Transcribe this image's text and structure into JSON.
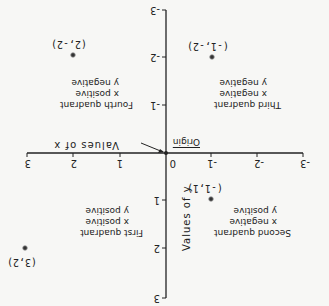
{
  "diagram": {
    "orientation_note": "Image rendered rotated 180 degrees",
    "x_axis": {
      "title": "Values of x",
      "ticks": [
        "-3",
        "-2",
        "-1",
        "0",
        "1",
        "2",
        "3"
      ]
    },
    "y_axis": {
      "title": "Values of y",
      "ticks": [
        "3",
        "2",
        "1",
        "-1",
        "-2",
        "-3"
      ]
    },
    "origin_label": "Origin",
    "zero_label": "0",
    "quadrants": [
      {
        "name": "First quadrant",
        "x": "x positive",
        "y": "y positive"
      },
      {
        "name": "Second quadrant",
        "x": "x negative",
        "y": "y positive"
      },
      {
        "name": "Third quadrant",
        "x": "x negative",
        "y": "y negative"
      },
      {
        "name": "Fourth quadrant",
        "x": "x positive",
        "y": "y negative"
      }
    ],
    "points": [
      {
        "label": "(3,2)",
        "x": 3,
        "y": 2
      },
      {
        "label": "(-1,1)",
        "x": -1,
        "y": 1
      },
      {
        "label": "(-1,-2)",
        "x": -1,
        "y": -2
      },
      {
        "label": "(2,-2)",
        "x": 2,
        "y": -2
      }
    ],
    "colors": {
      "ink": "#222222",
      "background": "#f7f7f5"
    }
  }
}
